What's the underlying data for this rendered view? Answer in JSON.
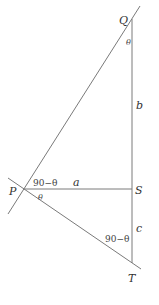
{
  "diagram": {
    "points": {
      "P": {
        "label": "P",
        "x": 23,
        "y": 189
      },
      "Q": {
        "label": "Q",
        "x": 132,
        "y": 19
      },
      "S": {
        "label": "S",
        "x": 132,
        "y": 189
      },
      "T": {
        "label": "T",
        "x": 132,
        "y": 263
      }
    },
    "segments": {
      "a": "a",
      "b": "b",
      "c": "c"
    },
    "angles": {
      "at_Q": "θ",
      "at_P_upper": "90−θ",
      "at_P_lower": "θ",
      "at_T": "90−θ"
    },
    "line_color": "#7a7a7a",
    "text_color": "#333333"
  }
}
